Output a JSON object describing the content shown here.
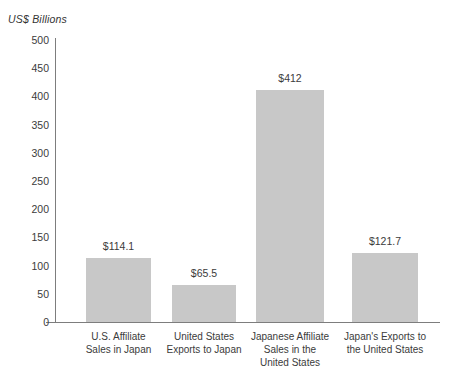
{
  "chart_data": {
    "type": "bar",
    "title": "",
    "subtitle": "",
    "xlabel": "",
    "ylabel": "US$ Billions",
    "ylim": [
      0,
      500
    ],
    "ytick_step": 50,
    "grid": false,
    "legend": "none",
    "categories": [
      "U.S. Affiliate\nSales in Japan",
      "United States\nExports to Japan",
      "Japanese Affiliate\nSales in the\nUnited States",
      "Japan's Exports to\nthe United States"
    ],
    "values": [
      114.1,
      65.5,
      412,
      121.7
    ],
    "value_labels": [
      "$114.1",
      "$65.5",
      "$412",
      "$121.7"
    ],
    "ytick_labels": [
      "500",
      "450",
      "400",
      "350",
      "300",
      "250",
      "200",
      "150",
      "100",
      "50",
      "0"
    ],
    "ytick_values": [
      500,
      450,
      400,
      350,
      300,
      250,
      200,
      150,
      100,
      50,
      0
    ],
    "bar_color": "#c8c8c8",
    "axis_color": "#7d7d7d",
    "text_color": "#3b3b3b"
  },
  "axis": {
    "unit_caption": "US$ Billions"
  }
}
